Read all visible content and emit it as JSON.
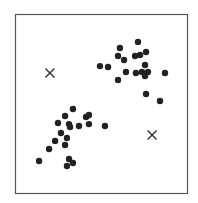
{
  "chart_data": {
    "type": "scatter",
    "title": "",
    "xlabel": "",
    "ylabel": "",
    "xlim": [
      0,
      10
    ],
    "ylim": [
      0,
      10
    ],
    "grid": false,
    "axes_ticks": false,
    "frame": true,
    "series": [
      {
        "name": "data points",
        "marker": "circle",
        "color": "#222222",
        "points": [
          [
            7.15,
            8.44
          ],
          [
            6.1,
            8.1
          ],
          [
            5.99,
            7.65
          ],
          [
            5.99,
            6.31
          ],
          [
            6.34,
            7.43
          ],
          [
            6.98,
            7.65
          ],
          [
            7.27,
            7.71
          ],
          [
            7.62,
            7.88
          ],
          [
            4.94,
            7.09
          ],
          [
            5.41,
            7.04
          ],
          [
            6.45,
            6.76
          ],
          [
            7.03,
            6.7
          ],
          [
            7.38,
            6.76
          ],
          [
            7.56,
            7.15
          ],
          [
            7.73,
            6.76
          ],
          [
            7.56,
            6.54
          ],
          [
            8.72,
            6.7
          ],
          [
            7.62,
            5.53
          ],
          [
            8.43,
            5.14
          ],
          [
            3.37,
            4.69
          ],
          [
            2.91,
            4.3
          ],
          [
            4.13,
            4.25
          ],
          [
            4.3,
            4.36
          ],
          [
            2.5,
            3.91
          ],
          [
            3.14,
            3.85
          ],
          [
            3.2,
            3.69
          ],
          [
            3.72,
            3.74
          ],
          [
            4.3,
            3.85
          ],
          [
            5.23,
            3.74
          ],
          [
            2.67,
            3.35
          ],
          [
            2.33,
            2.91
          ],
          [
            3.02,
            3.07
          ],
          [
            2.91,
            2.68
          ],
          [
            1.98,
            2.46
          ],
          [
            1.4,
            1.79
          ],
          [
            3.14,
            1.9
          ],
          [
            3.37,
            1.68
          ],
          [
            3.02,
            1.51
          ]
        ]
      },
      {
        "name": "centroids",
        "marker": "x",
        "color": "#333333",
        "points": [
          [
            2.03,
            6.7
          ],
          [
            7.97,
            3.24
          ]
        ]
      }
    ]
  },
  "plot_pixels": {
    "frame": {
      "left": 15,
      "top": 14,
      "right": 187,
      "bottom": 193
    },
    "dot_radius": 3.2,
    "x_size": 4.5
  }
}
